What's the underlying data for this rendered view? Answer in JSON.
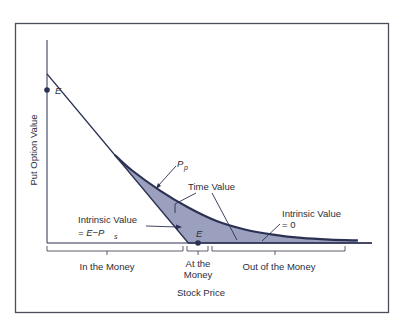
{
  "chart_data": {
    "type": "line",
    "title": "",
    "xlabel": "Stock Price",
    "ylabel": "Put Option Value",
    "grid": false,
    "exercise_price_label": "E",
    "exercise_price": 1.0,
    "xlim": [
      0,
      2.3
    ],
    "ylim": [
      0,
      1.2
    ],
    "series": [
      {
        "name": "Intrinsic Value (E - Ps)",
        "x": [
          0,
          1.0,
          2.3
        ],
        "y": [
          1.0,
          0,
          0
        ]
      },
      {
        "name": "Put Price Pp",
        "x": [
          0.48,
          0.6,
          0.8,
          1.0,
          1.2,
          1.4,
          1.6,
          1.8,
          2.0,
          2.2
        ],
        "y": [
          0.52,
          0.43,
          0.31,
          0.21,
          0.13,
          0.08,
          0.05,
          0.03,
          0.02,
          0.015
        ]
      }
    ],
    "shaded_region": "Time Value (between Pp and intrinsic value)",
    "annotations": {
      "e_top": "E",
      "e_axis": "E",
      "pp_label": "P",
      "pp_sub": "p",
      "time_value": "Time Value",
      "intrinsic_left_1": "Intrinsic Value",
      "intrinsic_left_2": "= E−P",
      "intrinsic_left_sub": "s",
      "intrinsic_right_1": "Intrinsic Value",
      "intrinsic_right_2": "= 0"
    },
    "regions": [
      {
        "label": "In the Money"
      },
      {
        "label_1": "At the",
        "label_2": "Money"
      },
      {
        "label": "Out of the Money"
      }
    ],
    "colors": {
      "line": "#2b3150",
      "fill": "#9aa0bd",
      "frame": "#4a4e5c"
    }
  }
}
